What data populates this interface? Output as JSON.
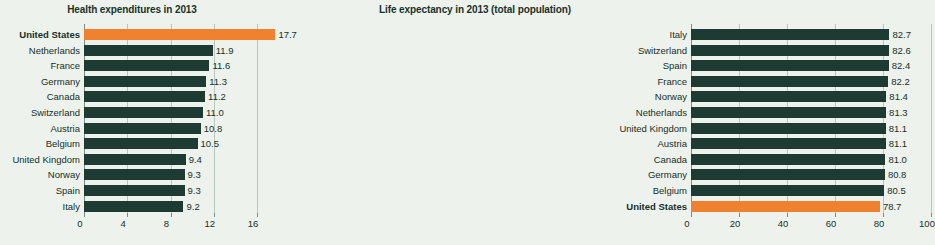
{
  "chart_data": [
    {
      "type": "bar",
      "orientation": "horizontal",
      "title": "Health expenditures in 2013",
      "xlabel": "",
      "ylabel": "",
      "xlim": [
        0,
        17.7
      ],
      "axis_max": 16,
      "ticks": [
        0,
        4,
        8,
        12,
        16
      ],
      "tick_labels": [
        "0",
        "4",
        "8",
        "12",
        "16"
      ],
      "grid": true,
      "legend": "none",
      "highlight_color": "#f0812f",
      "bar_color": "#1d3a33",
      "categories": [
        "United States",
        "Netherlands",
        "France",
        "Germany",
        "Canada",
        "Switzerland",
        "Austria",
        "Belgium",
        "United Kingdom",
        "Norway",
        "Spain",
        "Italy"
      ],
      "values": [
        17.7,
        11.9,
        11.6,
        11.3,
        11.2,
        11.0,
        10.8,
        10.5,
        9.4,
        9.3,
        9.3,
        9.2
      ],
      "value_labels": [
        "17.7",
        "11.9",
        "11.6",
        "11.3",
        "11.2",
        "11.0",
        "10.8",
        "10.5",
        "9.4",
        "9.3",
        "9.3",
        "9.2"
      ],
      "highlighted": [
        true,
        false,
        false,
        false,
        false,
        false,
        false,
        false,
        false,
        false,
        false,
        false
      ]
    },
    {
      "type": "bar",
      "orientation": "horizontal",
      "title": "Life expectancy in 2013 (total population)",
      "xlabel": "",
      "ylabel": "",
      "xlim": [
        0,
        100
      ],
      "axis_max": 100,
      "ticks": [
        0,
        20,
        40,
        60,
        80,
        100
      ],
      "tick_labels": [
        "0",
        "20",
        "40",
        "60",
        "80",
        "100"
      ],
      "grid": true,
      "legend": "none",
      "highlight_color": "#f0812f",
      "bar_color": "#1d3a33",
      "categories": [
        "Italy",
        "Switzerland",
        "Spain",
        "France",
        "Norway",
        "Netherlands",
        "United Kingdom",
        "Austria",
        "Canada",
        "Germany",
        "Belgium",
        "United States"
      ],
      "values": [
        82.7,
        82.6,
        82.4,
        82.2,
        81.4,
        81.3,
        81.1,
        81.1,
        81.0,
        80.8,
        80.5,
        78.7
      ],
      "value_labels": [
        "82.7",
        "82.6",
        "82.4",
        "82.2",
        "81.4",
        "81.3",
        "81.1",
        "81.1",
        "81.0",
        "80.8",
        "80.5",
        "78.7"
      ],
      "highlighted": [
        false,
        false,
        false,
        false,
        false,
        false,
        false,
        false,
        false,
        false,
        false,
        true
      ]
    }
  ]
}
